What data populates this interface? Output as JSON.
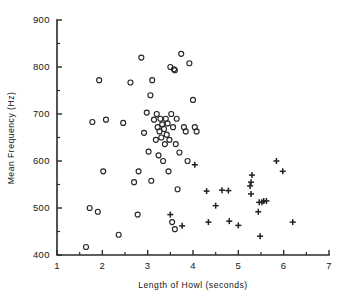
{
  "chart_data": {
    "type": "scatter",
    "title": "",
    "xlabel": "Length of Howl (seconds)",
    "ylabel": "Mean Frequency (Hz)",
    "xlim": [
      1,
      7
    ],
    "ylim": [
      400,
      900
    ],
    "grid": false,
    "legend": "none",
    "x_ticks": [
      1,
      2,
      3,
      4,
      5,
      6,
      7
    ],
    "x_tick_labels": [
      "1",
      "2",
      "3",
      "4",
      "5",
      "6",
      "7"
    ],
    "x_minor_ticks": [
      1.5,
      2.5,
      3.5,
      4.5,
      5.5,
      6.5
    ],
    "y_ticks": [
      400,
      500,
      600,
      700,
      800,
      900
    ],
    "y_tick_labels": [
      "400",
      "500",
      "600",
      "700",
      "800",
      "900"
    ],
    "y_minor_ticks": [
      450,
      550,
      650,
      750,
      850
    ],
    "series": [
      {
        "name": "open-circle",
        "marker": "circle",
        "color": "#262626",
        "points": [
          [
            1.64,
            417
          ],
          [
            1.72,
            500
          ],
          [
            1.78,
            683
          ],
          [
            1.9,
            492
          ],
          [
            1.93,
            772
          ],
          [
            2.02,
            578
          ],
          [
            2.08,
            688
          ],
          [
            2.36,
            443
          ],
          [
            2.46,
            681
          ],
          [
            2.62,
            767
          ],
          [
            2.7,
            555
          ],
          [
            2.78,
            486
          ],
          [
            2.8,
            578
          ],
          [
            2.86,
            820
          ],
          [
            2.92,
            660
          ],
          [
            2.98,
            703
          ],
          [
            3.02,
            620
          ],
          [
            3.06,
            740
          ],
          [
            3.08,
            558
          ],
          [
            3.1,
            772
          ],
          [
            3.14,
            688
          ],
          [
            3.18,
            645
          ],
          [
            3.2,
            700
          ],
          [
            3.22,
            672
          ],
          [
            3.24,
            612
          ],
          [
            3.26,
            663
          ],
          [
            3.28,
            690
          ],
          [
            3.3,
            650
          ],
          [
            3.32,
            678
          ],
          [
            3.34,
            600
          ],
          [
            3.36,
            668
          ],
          [
            3.38,
            636
          ],
          [
            3.4,
            690
          ],
          [
            3.42,
            656
          ],
          [
            3.44,
            680
          ],
          [
            3.46,
            578
          ],
          [
            3.48,
            645
          ],
          [
            3.5,
            800
          ],
          [
            3.52,
            700
          ],
          [
            3.56,
            672
          ],
          [
            3.58,
            795
          ],
          [
            3.6,
            793
          ],
          [
            3.62,
            636
          ],
          [
            3.64,
            690
          ],
          [
            3.66,
            540
          ],
          [
            3.7,
            618
          ],
          [
            3.74,
            828
          ],
          [
            3.8,
            672
          ],
          [
            3.84,
            663
          ],
          [
            3.88,
            600
          ],
          [
            3.92,
            808
          ],
          [
            4.0,
            730
          ],
          [
            4.04,
            672
          ],
          [
            4.08,
            663
          ],
          [
            3.54,
            470
          ],
          [
            3.6,
            455
          ]
        ]
      },
      {
        "name": "plus",
        "marker": "plus",
        "color": "#202020",
        "points": [
          [
            3.5,
            486
          ],
          [
            3.76,
            462
          ],
          [
            4.04,
            592
          ],
          [
            4.3,
            536
          ],
          [
            4.34,
            470
          ],
          [
            4.5,
            505
          ],
          [
            4.64,
            538
          ],
          [
            4.78,
            537
          ],
          [
            4.8,
            472
          ],
          [
            5.0,
            463
          ],
          [
            5.26,
            547
          ],
          [
            5.28,
            530
          ],
          [
            5.28,
            555
          ],
          [
            5.3,
            570
          ],
          [
            5.44,
            492
          ],
          [
            5.46,
            512
          ],
          [
            5.48,
            440
          ],
          [
            5.52,
            512
          ],
          [
            5.56,
            515
          ],
          [
            5.62,
            515
          ],
          [
            5.84,
            600
          ],
          [
            5.98,
            578
          ],
          [
            6.2,
            470
          ]
        ]
      }
    ]
  },
  "axes": {
    "geometry": {
      "left_px": 57,
      "right_px": 329,
      "top_px": 20,
      "bottom_px": 255
    }
  }
}
